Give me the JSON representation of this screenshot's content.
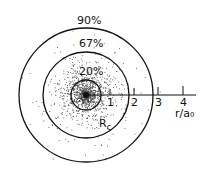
{
  "diagram": {
    "type": "probability-density-dot-plot",
    "center": [
      86,
      95
    ],
    "contours": [
      {
        "label": "20%",
        "radius": 15
      },
      {
        "label": "67%",
        "radius": 43
      },
      {
        "label": "90%",
        "radius": 67
      }
    ],
    "axis": {
      "label": "r/a₀",
      "ticks": [
        "1",
        "2",
        "3",
        "4"
      ]
    },
    "marker_label": "R",
    "marker_sub": "c",
    "colors": {
      "ink": "#111111",
      "background": "#ffffff"
    }
  }
}
